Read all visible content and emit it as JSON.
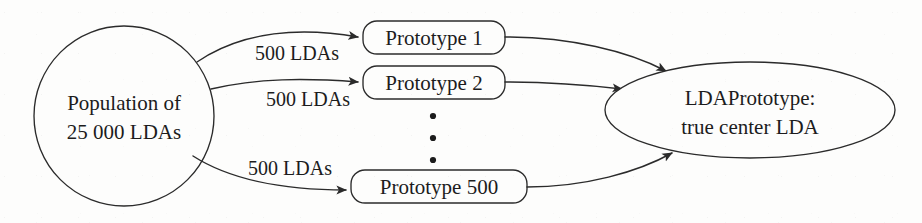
{
  "figure": {
    "type": "flow-diagram",
    "background_color": "#fdfdfc",
    "stroke_color": "#2b2b2b",
    "text_color": "#1c1c1c"
  },
  "nodes": {
    "source": {
      "shape": "circle",
      "line1": "Population of",
      "line2": "25 000 LDAs"
    },
    "prototypes": [
      {
        "label": "Prototype 1"
      },
      {
        "label": "Prototype 2"
      },
      {
        "label": "Prototype 500"
      }
    ],
    "ellipsis": {
      "glyph": "•",
      "count": 3
    },
    "result": {
      "shape": "ellipse",
      "line1": "LDAPrototype:",
      "line2": "true center LDA"
    }
  },
  "edges": {
    "sampling_labels": [
      "500 LDAs",
      "500 LDAs",
      "500 LDAs"
    ]
  }
}
